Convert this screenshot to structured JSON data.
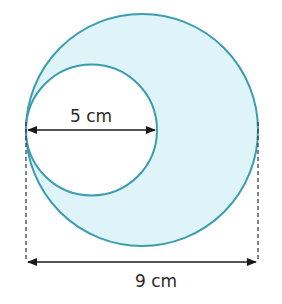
{
  "diagram": {
    "outer_circle": {
      "diameter_label": "9 cm",
      "fill": "#dff4f8",
      "stroke": "#3a9db0"
    },
    "inner_circle": {
      "diameter_label": "5 cm",
      "fill": "#ffffff",
      "stroke": "#3a9db0"
    },
    "arrow_color": "#1a1a1a"
  }
}
